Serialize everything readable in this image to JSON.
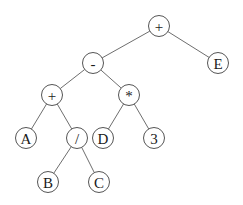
{
  "diagram": {
    "type": "expression-tree",
    "node_radius": 10.5,
    "nodes": [
      {
        "id": "n_root",
        "label": "+",
        "x": 159,
        "y": 26
      },
      {
        "id": "n_minus",
        "label": "-",
        "x": 93,
        "y": 63
      },
      {
        "id": "n_E",
        "label": "E",
        "x": 218,
        "y": 63
      },
      {
        "id": "n_plus",
        "label": "+",
        "x": 52,
        "y": 95
      },
      {
        "id": "n_mul",
        "label": "*",
        "x": 129,
        "y": 95
      },
      {
        "id": "n_A",
        "label": "A",
        "x": 26,
        "y": 138
      },
      {
        "id": "n_div",
        "label": "/",
        "x": 77,
        "y": 138
      },
      {
        "id": "n_D",
        "label": "D",
        "x": 103,
        "y": 138
      },
      {
        "id": "n_3",
        "label": "3",
        "x": 154,
        "y": 138
      },
      {
        "id": "n_B",
        "label": "B",
        "x": 48,
        "y": 182
      },
      {
        "id": "n_C",
        "label": "C",
        "x": 99,
        "y": 182
      }
    ],
    "edges": [
      {
        "from": "n_root",
        "to": "n_minus"
      },
      {
        "from": "n_root",
        "to": "n_E"
      },
      {
        "from": "n_minus",
        "to": "n_plus"
      },
      {
        "from": "n_minus",
        "to": "n_mul"
      },
      {
        "from": "n_plus",
        "to": "n_A"
      },
      {
        "from": "n_plus",
        "to": "n_div"
      },
      {
        "from": "n_mul",
        "to": "n_D"
      },
      {
        "from": "n_mul",
        "to": "n_3"
      },
      {
        "from": "n_div",
        "to": "n_B"
      },
      {
        "from": "n_div",
        "to": "n_C"
      }
    ],
    "expression": "((A + (B / C)) - (D * 3)) + E",
    "colors": {
      "edge": "#6e6e6e",
      "node_stroke": "#555555",
      "node_fill": "#ffffff",
      "text": "#1a1a1a"
    }
  }
}
